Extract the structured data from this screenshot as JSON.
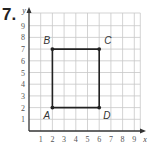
{
  "problem": {
    "number": "7."
  },
  "chart_data": {
    "type": "scatter",
    "title": "",
    "xlabel": "x",
    "ylabel": "y",
    "xlim": [
      0,
      9
    ],
    "ylim": [
      0,
      9
    ],
    "grid": true,
    "x_ticks": [
      "1",
      "2",
      "3",
      "4",
      "5",
      "6",
      "7",
      "8",
      "9"
    ],
    "y_ticks": [
      "1",
      "2",
      "3",
      "4",
      "5",
      "6",
      "7",
      "8",
      "9"
    ],
    "points": [
      {
        "label": "A",
        "x": 2,
        "y": 2
      },
      {
        "label": "B",
        "x": 2,
        "y": 7
      },
      {
        "label": "C",
        "x": 6,
        "y": 7
      },
      {
        "label": "D",
        "x": 6,
        "y": 2
      }
    ],
    "polygon": [
      "A",
      "B",
      "C",
      "D"
    ]
  },
  "colors": {
    "grid": "#c8c8c8",
    "axis": "#333333",
    "shape": "#222222"
  }
}
